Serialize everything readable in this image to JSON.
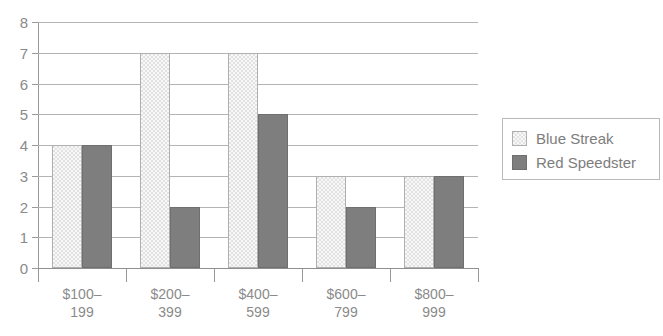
{
  "chart_data": {
    "type": "bar",
    "title": "",
    "subtitle": "",
    "xlabel": "",
    "ylabel": "",
    "categories": [
      "$100–199",
      "$200–399",
      "$400–599",
      "$600–799",
      "$800–999"
    ],
    "series": [
      {
        "name": "Blue Streak",
        "color": "#e2e2e2",
        "values": [
          4,
          7,
          7,
          3,
          3
        ]
      },
      {
        "name": "Red Speedster",
        "color": "#7e7e7e",
        "values": [
          4,
          2,
          5,
          2,
          3
        ]
      }
    ],
    "ylim": [
      0,
      8
    ],
    "ytick_values": [
      0,
      1,
      2,
      3,
      4,
      5,
      6,
      7,
      8
    ],
    "ytick_labels": [
      "0",
      "1",
      "2",
      "3",
      "4",
      "5",
      "6",
      "7",
      "8"
    ],
    "grid": true,
    "grid_axis": "y",
    "legend_position": "right",
    "bar_group_style": "adjacent"
  },
  "legend": {
    "entries": [
      {
        "label": "Blue Streak"
      },
      {
        "label": "Red Speedster"
      }
    ]
  }
}
